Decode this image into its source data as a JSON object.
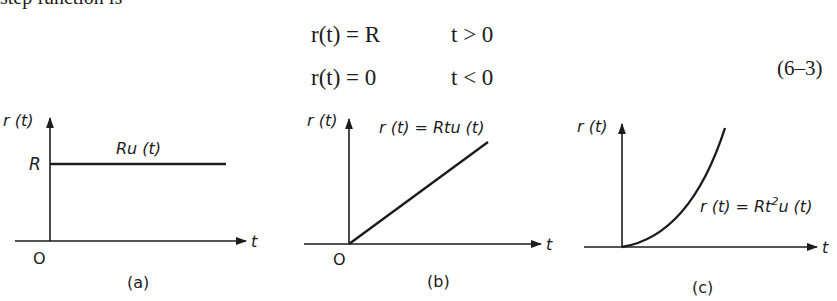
{
  "intro_text": "step function is",
  "equation": {
    "rows": [
      {
        "lhs": "r(t) = R",
        "condition": "t > 0"
      },
      {
        "lhs": "r(t) = 0",
        "condition": "t < 0"
      }
    ],
    "number": "(6–3)"
  },
  "figures": [
    {
      "id": "a",
      "caption": "(a)",
      "y_label": "r (t)",
      "x_label": "t",
      "origin_label": "O",
      "level_label": "R",
      "curve_label": "Ru (t)",
      "curve_type": "step"
    },
    {
      "id": "b",
      "caption": "(b)",
      "y_label": "r (t)",
      "x_label": "t",
      "origin_label": "O",
      "curve_label": "r (t) = Rtu (t)",
      "curve_type": "ramp"
    },
    {
      "id": "c",
      "caption": "(c)",
      "y_label": "r (t)",
      "x_label": "t",
      "curve_label_main": "r (t) = Rt",
      "curve_label_sup": "2",
      "curve_label_tail": "u (t)",
      "curve_type": "parabolic"
    }
  ]
}
